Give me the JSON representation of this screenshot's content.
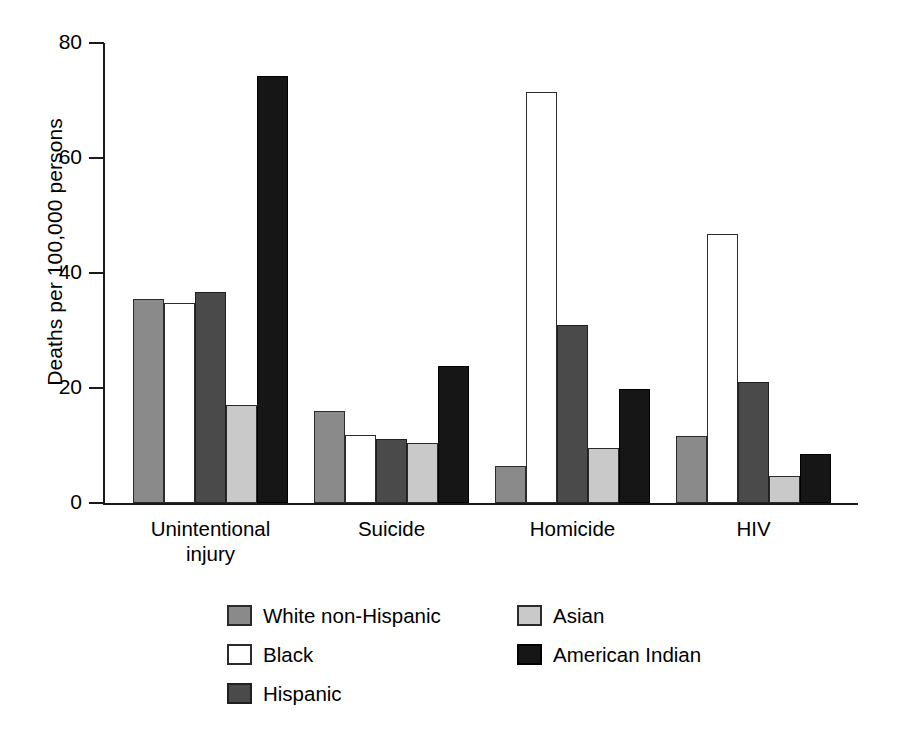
{
  "chart_data": {
    "type": "bar",
    "title": "",
    "subtitle": "",
    "xlabel": "",
    "ylabel": "Deaths per 100,000 persons",
    "categories": [
      "Unintentional injury",
      "Suicide",
      "Homicide",
      "HIV"
    ],
    "category_lines": [
      [
        "Unintentional",
        "injury"
      ],
      [
        "Suicide"
      ],
      [
        "Homicide"
      ],
      [
        "HIV"
      ]
    ],
    "ylim": [
      0,
      80
    ],
    "yticks": [
      0,
      20,
      40,
      60,
      80
    ],
    "ytick_labels": [
      "0",
      "20",
      "40",
      "60",
      "80"
    ],
    "grid": false,
    "legend_position": "bottom",
    "series": [
      {
        "name": "White non-Hispanic",
        "color": "#8a8a8a",
        "border": "#2b2b2b",
        "values": [
          35.4,
          16.0,
          6.5,
          11.7
        ]
      },
      {
        "name": "Black",
        "color": "#ffffff",
        "border": "#2b2b2b",
        "values": [
          34.7,
          11.8,
          71.5,
          46.7
        ]
      },
      {
        "name": "Hispanic",
        "color": "#4a4a4a",
        "border": "#1f1f1f",
        "values": [
          36.7,
          11.2,
          31.0,
          21.0
        ]
      },
      {
        "name": "Asian",
        "color": "#c9c9c9",
        "border": "#2b2b2b",
        "values": [
          17.0,
          10.5,
          9.6,
          4.7
        ]
      },
      {
        "name": "American Indian",
        "color": "#161616",
        "border": "#000000",
        "values": [
          74.2,
          23.9,
          19.9,
          8.6
        ]
      }
    ]
  },
  "axis": {
    "y_title": "Deaths per 100,000 persons"
  },
  "legend": {
    "left_column": [
      {
        "label": "White non-Hispanic",
        "color": "#8a8a8a",
        "border": "#2b2b2b",
        "icon": "legend-swatch-white-non-hispanic"
      },
      {
        "label": "Black",
        "color": "#ffffff",
        "border": "#2b2b2b",
        "icon": "legend-swatch-black"
      },
      {
        "label": "Hispanic",
        "color": "#4a4a4a",
        "border": "#1f1f1f",
        "icon": "legend-swatch-hispanic"
      }
    ],
    "right_column": [
      {
        "label": "Asian",
        "color": "#c9c9c9",
        "border": "#2b2b2b",
        "icon": "legend-swatch-asian"
      },
      {
        "label": "American Indian",
        "color": "#161616",
        "border": "#000000",
        "icon": "legend-swatch-american-indian"
      }
    ]
  }
}
